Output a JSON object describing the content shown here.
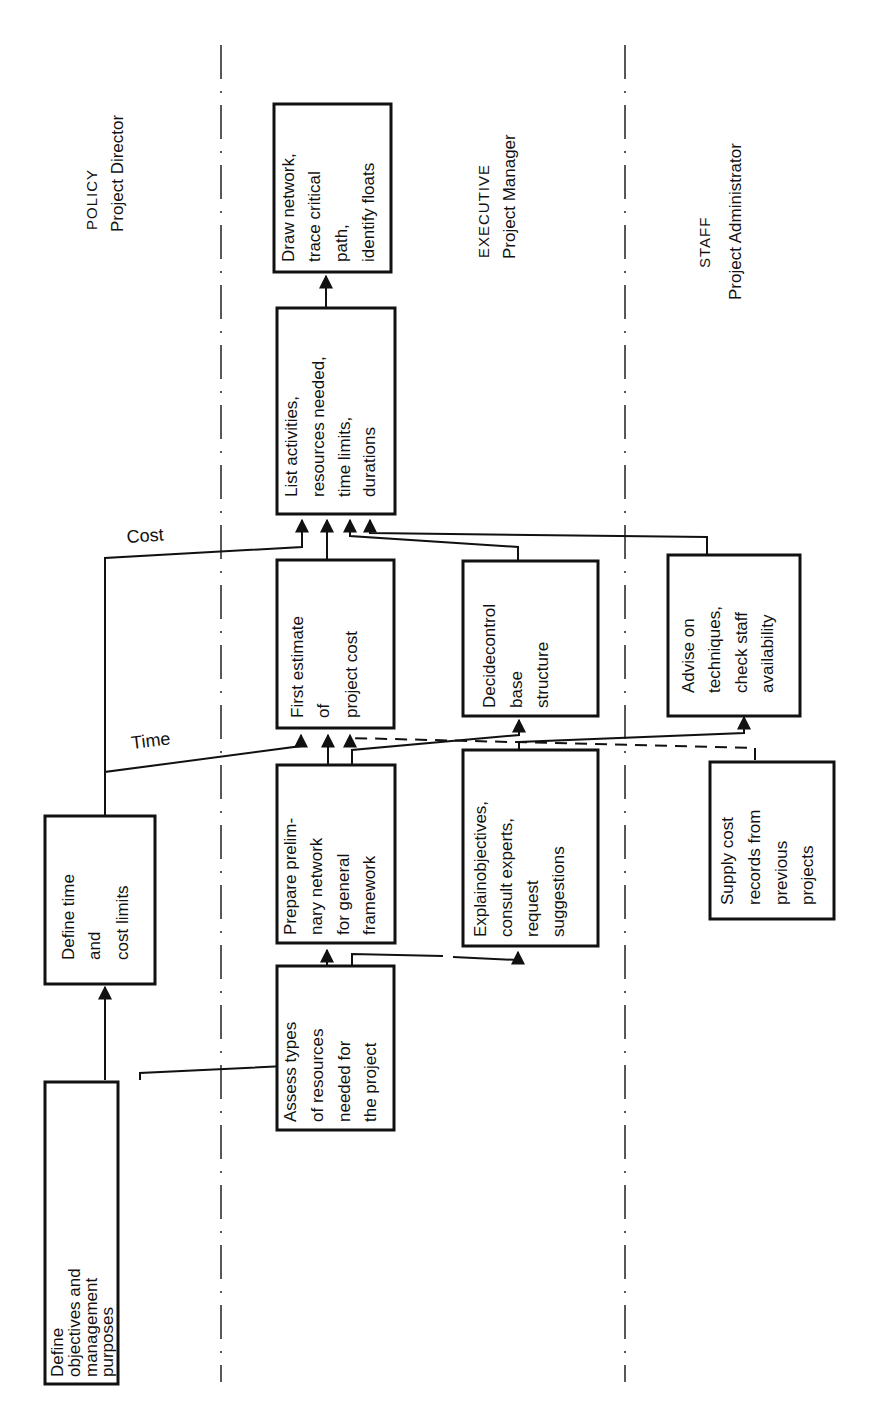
{
  "diagram": {
    "orientation": "rotated-90-ccw",
    "lanes": [
      {
        "id": "policy",
        "title": "POLICY",
        "role": "Project Director"
      },
      {
        "id": "executive",
        "title": "EXECUTIVE",
        "role": "Project Manager"
      },
      {
        "id": "staff",
        "title": "STAFF",
        "role": "Project Administrator"
      }
    ],
    "boxes": {
      "define_objectives": {
        "lines": [
          "Define",
          "objectives  and",
          "management",
          "purposes"
        ]
      },
      "define_time_cost": {
        "lines": [
          "Define time",
          "and",
          "cost limits"
        ]
      },
      "assess_types": {
        "lines": [
          "Assess types",
          "of resources",
          "needed for",
          "the project"
        ]
      },
      "prepare_network": {
        "lines": [
          "Prepare prelim-",
          "nary  network",
          "for  general",
          "framework"
        ]
      },
      "first_estimate": {
        "lines": [
          "First estimate",
          "of",
          "project cost"
        ]
      },
      "list_activities": {
        "lines": [
          "List activities,",
          "resources needed,",
          "time limits,",
          "durations"
        ]
      },
      "draw_network": {
        "lines": [
          "Draw network,",
          "trace critical",
          "path,",
          "identify floats"
        ]
      },
      "explain_objectives": {
        "lines": [
          "Explainobjectives,",
          "consult experts,",
          "request",
          "suggestions"
        ]
      },
      "decide_control": {
        "lines": [
          "Decidecontrol",
          "base",
          "structure"
        ]
      },
      "advise_techniques": {
        "lines": [
          "Advise on",
          "techniques,",
          "check staff",
          "availability"
        ]
      },
      "supply_cost": {
        "lines": [
          "Supply cost",
          "records from",
          "previous",
          "projects"
        ]
      }
    },
    "connector_labels": {
      "time": "Time",
      "cost": "Cost"
    }
  }
}
